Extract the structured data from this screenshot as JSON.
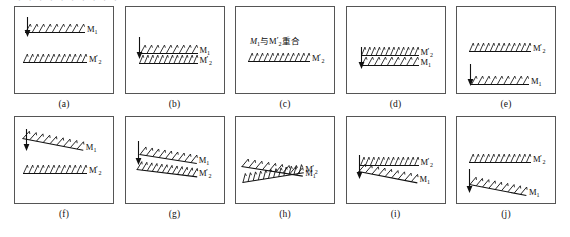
{
  "figure": {
    "title_fragment_cropped": "· · · · · · · · · ·",
    "mirror_label_m1": "M",
    "mirror_label_m1_sub": "1",
    "mirror_label_m2": "M",
    "mirror_label_m2_sub": "2",
    "mirror_label_m2_prime": "′",
    "note_c_prefix": "M",
    "note_c_sub1": "1",
    "note_c_mid": "与 M",
    "note_c_sub2": "2",
    "note_c_prime": "′",
    "note_c_suffix": "重合",
    "note_c_full": "M₁与M₂′重合"
  },
  "panels": [
    {
      "id": "a",
      "caption": "(a)",
      "description": "M1 horizontal upper with arrow, M2' horizontal lower, wide separation",
      "mirrors": [
        {
          "name": "M1",
          "label_main": "M",
          "label_sub": "1",
          "prime": false,
          "tilt_deg": 0,
          "x": 10,
          "y": 16,
          "length": 60,
          "hatch_count": 9
        },
        {
          "name": "M2prime",
          "label_main": "M",
          "label_sub": "2",
          "prime": true,
          "tilt_deg": 0,
          "x": 8,
          "y": 46,
          "length": 64,
          "hatch_count": 12
        }
      ],
      "arrow": {
        "x": 8,
        "y": 10,
        "length": 20,
        "direction": "down"
      }
    },
    {
      "id": "b",
      "caption": "(b)",
      "description": "M1 and M2' nearly coincident horizontal lines with arrow",
      "mirrors": [
        {
          "name": "M1",
          "label_main": "M",
          "label_sub": "1",
          "prime": false,
          "tilt_deg": 0,
          "x": 14,
          "y": 37,
          "length": 58,
          "hatch_count": 9
        },
        {
          "name": "M2prime",
          "label_main": "M",
          "label_sub": "2",
          "prime": true,
          "tilt_deg": 0,
          "x": 13,
          "y": 47,
          "length": 59,
          "hatch_count": 12
        }
      ],
      "arrow": {
        "x": 9,
        "y": 30,
        "length": 22,
        "direction": "down"
      }
    },
    {
      "id": "c",
      "caption": "(c)",
      "description": "M1 coincides with M2' - single line with Chinese annotation",
      "mirrors": [
        {
          "name": "M2prime",
          "label_main": "M",
          "label_sub": "2",
          "prime": true,
          "tilt_deg": 0,
          "x": 12,
          "y": 45,
          "length": 62,
          "hatch_count": 12
        }
      ],
      "arrow": null,
      "annotation": "M₁与M₂′重合"
    },
    {
      "id": "d",
      "caption": "(d)",
      "description": "M2' upper, M1 just below, nearly coincident, arrow down",
      "mirrors": [
        {
          "name": "M2prime",
          "label_main": "M",
          "label_sub": "2",
          "prime": true,
          "tilt_deg": 0,
          "x": 14,
          "y": 39,
          "length": 58,
          "hatch_count": 12
        },
        {
          "name": "M1",
          "label_main": "M",
          "label_sub": "1",
          "prime": false,
          "tilt_deg": 0,
          "x": 14,
          "y": 49,
          "length": 58,
          "hatch_count": 9
        }
      ],
      "arrow": {
        "x": 10,
        "y": 40,
        "length": 22,
        "direction": "down"
      }
    },
    {
      "id": "e",
      "caption": "(e)",
      "description": "M2' upper horizontal, M1 lower horizontal, wide separation, arrow down",
      "mirrors": [
        {
          "name": "M2prime",
          "label_main": "M",
          "label_sub": "2",
          "prime": true,
          "tilt_deg": 0,
          "x": 12,
          "y": 35,
          "length": 62,
          "hatch_count": 12
        },
        {
          "name": "M1",
          "label_main": "M",
          "label_sub": "1",
          "prime": false,
          "tilt_deg": 0,
          "x": 14,
          "y": 68,
          "length": 58,
          "hatch_count": 9
        }
      ],
      "arrow": {
        "x": 9,
        "y": 57,
        "length": 22,
        "direction": "down"
      }
    },
    {
      "id": "f",
      "caption": "(f)",
      "description": "M1 tilted upper, M2' horizontal lower, wide separation, arrow down",
      "mirrors": [
        {
          "name": "M1",
          "label_main": "M",
          "label_sub": "1",
          "prime": false,
          "tilt_deg": 11,
          "x": 8,
          "y": 12,
          "length": 62,
          "hatch_count": 9
        },
        {
          "name": "M2prime",
          "label_main": "M",
          "label_sub": "2",
          "prime": true,
          "tilt_deg": 0,
          "x": 8,
          "y": 47,
          "length": 64,
          "hatch_count": 12
        }
      ],
      "arrow": {
        "x": 7,
        "y": 12,
        "length": 22,
        "direction": "down"
      }
    },
    {
      "id": "g",
      "caption": "(g)",
      "description": "M1 tilted and M2' tilted nearly meeting, arrow down",
      "mirrors": [
        {
          "name": "M1",
          "label_main": "M",
          "label_sub": "1",
          "prime": false,
          "tilt_deg": 9,
          "x": 14,
          "y": 28,
          "length": 58,
          "hatch_count": 9
        },
        {
          "name": "M2prime",
          "label_main": "M",
          "label_sub": "2",
          "prime": true,
          "tilt_deg": 7,
          "x": 11,
          "y": 43,
          "length": 61,
          "hatch_count": 12
        }
      ],
      "arrow": {
        "x": 8,
        "y": 24,
        "length": 24,
        "direction": "down"
      }
    },
    {
      "id": "h",
      "caption": "(h)",
      "description": "M1 and M2' crossing at an angle, intersecting wedge",
      "mirrors": [
        {
          "name": "M2prime",
          "label_main": "M",
          "label_sub": "2",
          "prime": true,
          "tilt_deg": -9,
          "x": 6,
          "y": 56,
          "length": 62,
          "hatch_count": 12
        },
        {
          "name": "M1",
          "label_main": "M",
          "label_sub": "1",
          "prime": false,
          "tilt_deg": 9,
          "x": 6,
          "y": 40,
          "length": 62,
          "hatch_count": 9
        }
      ],
      "arrow": null
    },
    {
      "id": "i",
      "caption": "(i)",
      "description": "M2' horizontal upper, M1 tilted below, arrow down",
      "mirrors": [
        {
          "name": "M2prime",
          "label_main": "M",
          "label_sub": "2",
          "prime": true,
          "tilt_deg": 0,
          "x": 13,
          "y": 39,
          "length": 59,
          "hatch_count": 12
        },
        {
          "name": "M1",
          "label_main": "M",
          "label_sub": "1",
          "prime": false,
          "tilt_deg": 11,
          "x": 12,
          "y": 45,
          "length": 60,
          "hatch_count": 9
        }
      ],
      "arrow": {
        "x": 8,
        "y": 38,
        "length": 24,
        "direction": "down"
      }
    },
    {
      "id": "j",
      "caption": "(j)",
      "description": "M2' horizontal upper, M1 tilted at bottom, wide separation, arrow down",
      "mirrors": [
        {
          "name": "M2prime",
          "label_main": "M",
          "label_sub": "2",
          "prime": true,
          "tilt_deg": 0,
          "x": 12,
          "y": 36,
          "length": 62,
          "hatch_count": 12
        },
        {
          "name": "M1",
          "label_main": "M",
          "label_sub": "1",
          "prime": false,
          "tilt_deg": 11,
          "x": 13,
          "y": 58,
          "length": 58,
          "hatch_count": 9
        }
      ],
      "arrow": {
        "x": 8,
        "y": 52,
        "length": 24,
        "direction": "down"
      }
    }
  ],
  "colors": {
    "box_border": "#555555",
    "line": "#111111",
    "text": "#0d0d0d",
    "background": "#ffffff"
  }
}
